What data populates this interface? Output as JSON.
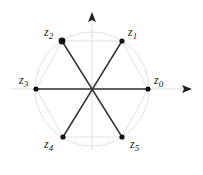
{
  "diagram": {
    "center": [
      92,
      89
    ],
    "radius": 56,
    "colors": {
      "lines": "#333333",
      "guides": "#dddddd",
      "axes": "#e0e0e0",
      "arrow": "#222222"
    },
    "points": [
      {
        "label": "z",
        "sub": "0",
        "x": 148,
        "y": 89,
        "lx": 154,
        "ly": 74
      },
      {
        "label": "z",
        "sub": "1",
        "x": 122,
        "y": 41,
        "lx": 128,
        "ly": 26
      },
      {
        "label": "z",
        "sub": "2",
        "x": 62,
        "y": 41,
        "lx": 44,
        "ly": 26
      },
      {
        "label": "z",
        "sub": "3",
        "x": 36,
        "y": 89,
        "lx": 19,
        "ly": 74
      },
      {
        "label": "z",
        "sub": "4",
        "x": 63,
        "y": 137,
        "lx": 44,
        "ly": 138
      },
      {
        "label": "z",
        "sub": "5",
        "x": 122,
        "y": 137,
        "lx": 130,
        "ly": 138
      }
    ]
  }
}
